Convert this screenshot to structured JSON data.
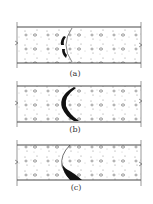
{
  "diagram": {
    "type": "concrete-section-crack-illustration",
    "panels": [
      {
        "id": "a",
        "label": "(a)",
        "crack_shape": "short-arc-center",
        "top": 27,
        "bottom": 63,
        "label_y": 75
      },
      {
        "id": "b",
        "label": "(b)",
        "crack_shape": "full-arc-c",
        "top": 86,
        "bottom": 122,
        "label_y": 131
      },
      {
        "id": "c",
        "label": "(c)",
        "crack_shape": "wedge-bottom",
        "top": 145,
        "bottom": 180,
        "label_y": 190
      }
    ],
    "colors": {
      "line": "#333333",
      "crack": "#111111",
      "aggregate": "#555555",
      "background": "#ffffff"
    }
  }
}
